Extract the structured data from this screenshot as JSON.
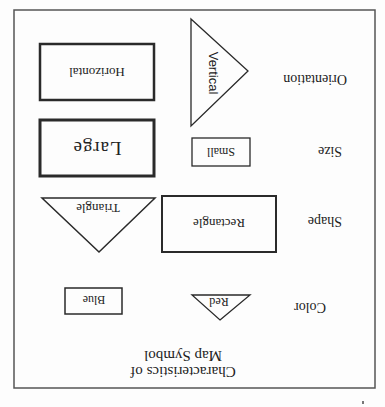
{
  "figure": {
    "title_line1": "Characteristics of",
    "title_line2": "Map Symbol",
    "orientation_note": "image rotated 180 degrees",
    "rows": [
      {
        "label": "Color",
        "symbols": [
          {
            "shape": "triangle",
            "text": "Red"
          },
          {
            "shape": "rectangle",
            "text": "Blue"
          }
        ]
      },
      {
        "label": "Shape",
        "symbols": [
          {
            "shape": "rectangle",
            "text": "Rectangle"
          },
          {
            "shape": "triangle",
            "text": "Triangle"
          }
        ]
      },
      {
        "label": "Size",
        "symbols": [
          {
            "shape": "rectangle",
            "text": "Small"
          },
          {
            "shape": "rectangle",
            "text": "Large"
          }
        ]
      },
      {
        "label": "Orientation",
        "symbols": [
          {
            "shape": "triangle",
            "text": "Vertical"
          },
          {
            "shape": "rectangle",
            "text": "Horizontal"
          }
        ]
      }
    ]
  },
  "colors": {
    "stroke": "#2a2a2a",
    "border": "#555555",
    "text": "#222222",
    "background": "#fdfdfd"
  }
}
